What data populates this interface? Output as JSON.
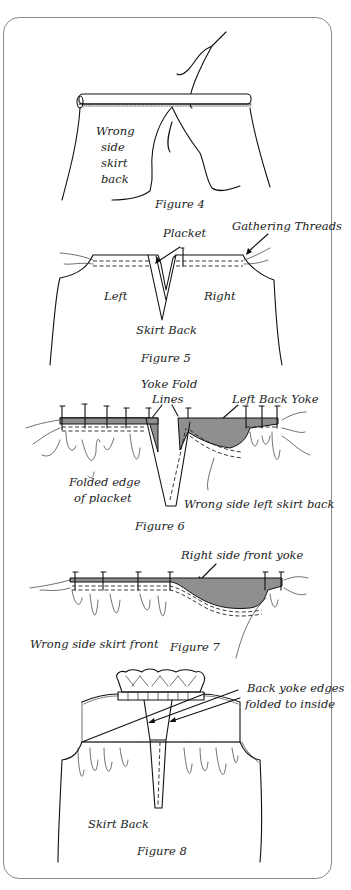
{
  "figures": [
    {
      "id": "figure-4",
      "caption": "Figure 4",
      "labels": {
        "wrong_side_1": "Wrong",
        "wrong_side_2": "side",
        "wrong_side_3": "skirt",
        "wrong_side_4": "back"
      }
    },
    {
      "id": "figure-5",
      "caption": "Figure 5",
      "labels": {
        "placket": "Placket",
        "gathering_threads": "Gathering Threads",
        "left": "Left",
        "right": "Right",
        "skirt_back": "Skirt Back"
      }
    },
    {
      "id": "figure-6",
      "caption": "Figure 6",
      "labels": {
        "yoke_fold_1": "Yoke Fold",
        "yoke_fold_2": "Lines",
        "left_back_yoke": "Left Back Yoke",
        "folded_edge_1": "Folded edge",
        "folded_edge_2": "of placket",
        "wrong_side_left": "Wrong side left skirt back"
      }
    },
    {
      "id": "figure-7",
      "caption": "Figure 7",
      "labels": {
        "right_side_front_yoke": "Right side front yoke",
        "wrong_side_front": "Wrong side skirt front"
      }
    },
    {
      "id": "figure-8",
      "caption": "Figure 8",
      "labels": {
        "back_yoke_1": "Back yoke edges",
        "back_yoke_2": "folded to inside",
        "skirt_back": "Skirt Back"
      }
    }
  ],
  "colors": {
    "yoke_fill": "#8f8f8f",
    "line": "#111111",
    "frame": "#8a8a8a"
  }
}
